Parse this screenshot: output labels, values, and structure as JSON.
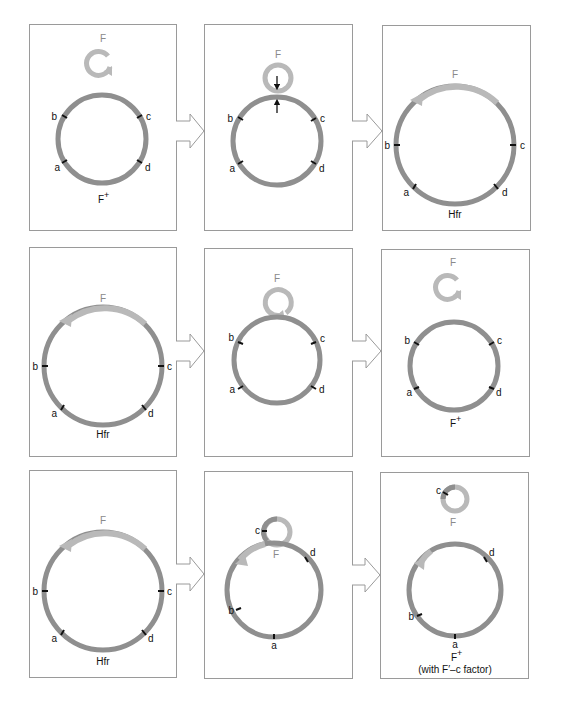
{
  "figure": {
    "colors": {
      "chromosome": "#8f8f8f",
      "f_factor": "#b9b9b9",
      "marker": "#111111",
      "frame": "#9a9a9a",
      "arrow": "#9a9a9a",
      "label": "#111111",
      "f_label": "#8a8a8a"
    },
    "rows": [
      {
        "panels": [
          {
            "id": "row1-panel1",
            "state": "free F plasmid beside chromosome",
            "f_label": "F",
            "markers": [
              "b",
              "c",
              "a",
              "d"
            ],
            "caption": "F",
            "caption_sup": "+"
          },
          {
            "id": "row1-panel2",
            "state": "F plasmid pairing with chromosome (recombination arrows)",
            "f_label": "F",
            "markers": [
              "b",
              "c",
              "a",
              "d"
            ],
            "caption": "",
            "caption_sup": ""
          },
          {
            "id": "row1-panel3",
            "state": "F integrated into chromosome",
            "f_label": "F",
            "markers": [
              "b",
              "c",
              "a",
              "d"
            ],
            "caption": "Hfr",
            "caption_sup": ""
          }
        ]
      },
      {
        "panels": [
          {
            "id": "row2-panel1",
            "state": "Hfr chromosome",
            "f_label": "F",
            "markers": [
              "b",
              "c",
              "a",
              "d"
            ],
            "caption": "Hfr",
            "caption_sup": ""
          },
          {
            "id": "row2-panel2",
            "state": "F looping out precisely",
            "f_label": "F",
            "markers": [
              "b",
              "c",
              "a",
              "d"
            ],
            "caption": "",
            "caption_sup": ""
          },
          {
            "id": "row2-panel3",
            "state": "F excised, cell restored",
            "f_label": "F",
            "markers": [
              "b",
              "c",
              "a",
              "d"
            ],
            "caption": "F",
            "caption_sup": "+"
          }
        ]
      },
      {
        "panels": [
          {
            "id": "row3-panel1",
            "state": "Hfr chromosome",
            "f_label": "F",
            "markers": [
              "b",
              "c",
              "a",
              "d"
            ],
            "caption": "Hfr",
            "caption_sup": ""
          },
          {
            "id": "row3-panel2",
            "state": "imprecise loop-out carrying gene c",
            "f_label": "F",
            "markers": [
              "c",
              "d",
              "b",
              "a"
            ],
            "caption": "",
            "caption_sup": ""
          },
          {
            "id": "row3-panel3",
            "state": "F-prime carrying c excised",
            "f_label": "F",
            "markers": [
              "c",
              "d",
              "b",
              "a"
            ],
            "caption": "F",
            "caption_sup": "+",
            "caption_line2": "(with F′–c factor)"
          }
        ]
      }
    ]
  }
}
